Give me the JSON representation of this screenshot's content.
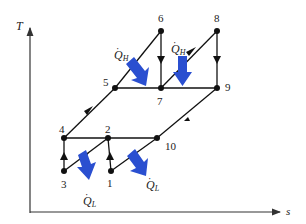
{
  "diagram": {
    "type": "T-s diagram (two-stage cascade refrigeration cycle)",
    "axes": {
      "y_label": "T",
      "x_label": "s"
    },
    "colors": {
      "line": "#111111",
      "heat_arrow": "#2a4fd0",
      "axis": "#333333"
    },
    "states": [
      {
        "id": "1",
        "label": "1",
        "x": 111,
        "y": 171
      },
      {
        "id": "2",
        "label": "2",
        "x": 108,
        "y": 138
      },
      {
        "id": "3",
        "label": "3",
        "x": 64,
        "y": 171
      },
      {
        "id": "4",
        "label": "4",
        "x": 64,
        "y": 138
      },
      {
        "id": "5",
        "label": "5",
        "x": 115,
        "y": 88
      },
      {
        "id": "6",
        "label": "6",
        "x": 161,
        "y": 31
      },
      {
        "id": "7",
        "label": "7",
        "x": 161,
        "y": 88
      },
      {
        "id": "8",
        "label": "8",
        "x": 217,
        "y": 31
      },
      {
        "id": "9",
        "label": "9",
        "x": 217,
        "y": 88
      },
      {
        "id": "10",
        "label": "10",
        "x": 157,
        "y": 138
      }
    ],
    "heat_labels": [
      {
        "id": "qh-left",
        "symbol": "Q",
        "sub": "H"
      },
      {
        "id": "qh-right",
        "symbol": "Q",
        "sub": "H"
      },
      {
        "id": "ql-left",
        "symbol": "Q",
        "sub": "L"
      },
      {
        "id": "ql-right",
        "symbol": "Q",
        "sub": "L"
      }
    ]
  }
}
